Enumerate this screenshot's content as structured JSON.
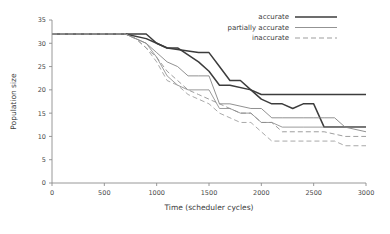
{
  "chart_data": {
    "type": "line",
    "title": "",
    "xlabel": "Time (scheduler cycles)",
    "ylabel": "Population size",
    "xlim": [
      0,
      3000
    ],
    "ylim": [
      0,
      35
    ],
    "xticks": [
      0,
      500,
      1000,
      1500,
      2000,
      2500,
      3000
    ],
    "yticks": [
      0,
      5,
      10,
      15,
      20,
      25,
      30,
      35
    ],
    "grid": false,
    "legend_position": "top-right",
    "legend": [
      {
        "label": "accurate",
        "style": "solid",
        "width": "thick",
        "color": "#3c3c3c"
      },
      {
        "label": "partially accurate",
        "style": "solid",
        "width": "thin",
        "color": "#808080"
      },
      {
        "label": "inaccurate",
        "style": "dashed",
        "width": "thin",
        "color": "#8c8c8c"
      }
    ],
    "series": [
      {
        "name": "accurate-1",
        "group": "accurate",
        "style": "solid",
        "width": "thick",
        "color": "#3c3c3c",
        "x": [
          0,
          700,
          900,
          1000,
          1100,
          1400,
          1500,
          1600,
          1700,
          1800,
          1900,
          2000,
          2100,
          3000
        ],
        "y": [
          32,
          32,
          32,
          30,
          29,
          28,
          28,
          25,
          22,
          22,
          20,
          19,
          19,
          19
        ]
      },
      {
        "name": "accurate-2",
        "group": "accurate",
        "style": "solid",
        "width": "thick",
        "color": "#3c3c3c",
        "x": [
          0,
          700,
          900,
          1000,
          1100,
          1200,
          1400,
          1500,
          1600,
          1700,
          1900,
          2000,
          2100,
          2200,
          2300,
          2400,
          2500,
          2600,
          3000
        ],
        "y": [
          32,
          32,
          31,
          30,
          29,
          29,
          26,
          24,
          21,
          21,
          20,
          18,
          17,
          17,
          16,
          17,
          17,
          12,
          12
        ]
      },
      {
        "name": "partially-accurate-1",
        "group": "partially accurate",
        "style": "solid",
        "width": "thin",
        "color": "#7d7d7d",
        "x": [
          0,
          700,
          800,
          900,
          1000,
          1100,
          1200,
          1300,
          1400,
          1500,
          1600,
          1700,
          1900,
          2000,
          2100,
          2200,
          2400,
          2500,
          2600,
          2700,
          2800,
          3000
        ],
        "y": [
          32,
          32,
          31,
          30,
          28,
          26,
          25,
          23,
          23,
          23,
          17,
          17,
          16,
          16,
          14,
          14,
          14,
          14,
          14,
          14,
          12,
          11
        ]
      },
      {
        "name": "partially-accurate-2",
        "group": "partially accurate",
        "style": "solid",
        "width": "thin",
        "color": "#8a8a8a",
        "x": [
          0,
          700,
          800,
          900,
          1000,
          1100,
          1200,
          1300,
          1500,
          1600,
          1700,
          1800,
          1900,
          2000,
          2100,
          2200,
          2400,
          2600,
          2800,
          3000
        ],
        "y": [
          32,
          32,
          31,
          30,
          27,
          23,
          21,
          20,
          20,
          16,
          16,
          15,
          15,
          13,
          13,
          12,
          12,
          12,
          12,
          12
        ]
      },
      {
        "name": "inaccurate-1",
        "group": "inaccurate",
        "style": "dashed",
        "width": "thin",
        "color": "#8c8c8c",
        "x": [
          0,
          700,
          800,
          900,
          1000,
          1100,
          1200,
          1300,
          1400,
          1500,
          1700,
          1800,
          1900,
          2000,
          2100,
          2200,
          2600,
          2800,
          3000
        ],
        "y": [
          32,
          32,
          31,
          29,
          27,
          24,
          22,
          20,
          19,
          18,
          16,
          15,
          15,
          13,
          13,
          11,
          11,
          10,
          10
        ]
      },
      {
        "name": "inaccurate-2",
        "group": "inaccurate",
        "style": "dashed",
        "width": "thin",
        "color": "#9a9a9a",
        "x": [
          0,
          700,
          800,
          900,
          1000,
          1100,
          1200,
          1300,
          1400,
          1500,
          1600,
          1700,
          1800,
          1900,
          2000,
          2100,
          2200,
          2700,
          2800,
          3000
        ],
        "y": [
          32,
          32,
          31,
          29,
          26,
          22,
          21,
          19,
          18,
          17,
          15,
          14,
          13,
          13,
          11,
          9,
          9,
          9,
          8,
          8
        ]
      }
    ]
  }
}
